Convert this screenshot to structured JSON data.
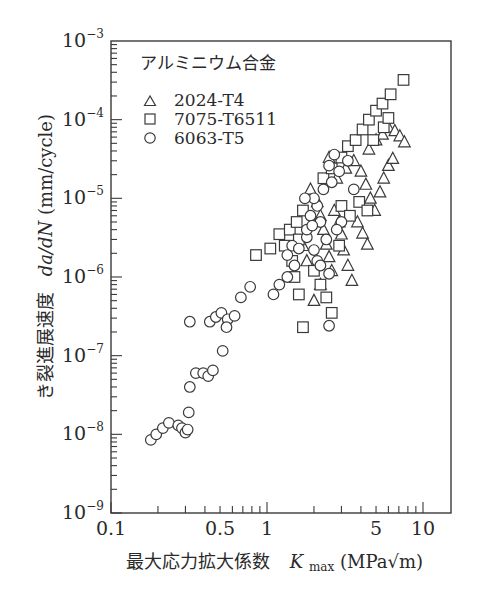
{
  "chart_data": {
    "type": "scatter",
    "title": "",
    "xlabel": "最大応力拡大係数  K_max (MPa√m)",
    "xlabel_parts": {
      "prefix": "最大応力拡大係数",
      "symbol": "K",
      "subscript": "max",
      "unit": "(MPa√m)"
    },
    "ylabel": "き裂進展速度  da/dN (mm/cycle)",
    "ylabel_parts": {
      "prefix": "き裂進展速度",
      "symbol": "da/dN",
      "unit": "(mm/cycle)"
    },
    "xscale": "log",
    "yscale": "log",
    "xlim": [
      0.1,
      15
    ],
    "ylim": [
      1e-09,
      0.001
    ],
    "x_tick_labels": [
      "0.1",
      "0.5",
      "1",
      "5",
      "10"
    ],
    "x_tick_values": [
      0.1,
      0.5,
      1,
      5,
      10
    ],
    "y_tick_labels": [
      {
        "base": "10",
        "exp": "−9",
        "value": 1e-09
      },
      {
        "base": "10",
        "exp": "−8",
        "value": 1e-08
      },
      {
        "base": "10",
        "exp": "−7",
        "value": 1e-07
      },
      {
        "base": "10",
        "exp": "−6",
        "value": 1e-06
      },
      {
        "base": "10",
        "exp": "−5",
        "value": 1e-05
      },
      {
        "base": "10",
        "exp": "−4",
        "value": 0.0001
      },
      {
        "base": "10",
        "exp": "−3",
        "value": 0.001
      }
    ],
    "grid": false,
    "legend": {
      "title": "アルミニウム合金",
      "position": "upper-left",
      "entries": [
        {
          "marker": "triangle",
          "label": "2024-T4"
        },
        {
          "marker": "square",
          "label": "7075-T6511"
        },
        {
          "marker": "circle",
          "label": "6063-T5"
        }
      ]
    },
    "series": [
      {
        "name": "2024-T4",
        "marker": "triangle",
        "points": [
          [
            1.9,
            1.3e-05
          ],
          [
            2.1,
            9e-06
          ],
          [
            2.2,
            6e-06
          ],
          [
            2.3,
            4e-06
          ],
          [
            2.4,
            2.6e-06
          ],
          [
            2.5,
            1.8e-06
          ],
          [
            2.6,
            1.2e-06
          ],
          [
            2.2,
            8e-07
          ],
          [
            2.0,
            5e-07
          ],
          [
            2.7,
            7e-06
          ],
          [
            2.9,
            5e-06
          ],
          [
            3.0,
            3.5e-06
          ],
          [
            3.1,
            2.2e-06
          ],
          [
            3.3,
            1.4e-06
          ],
          [
            3.5,
            9e-07
          ],
          [
            2.8,
            1.8e-05
          ],
          [
            3.2,
            2.4e-05
          ],
          [
            3.6,
            3e-05
          ],
          [
            4.0,
            2.2e-05
          ],
          [
            4.3,
            1.5e-05
          ],
          [
            4.6,
            1e-05
          ],
          [
            4.9,
            7e-06
          ],
          [
            5.3,
            1.2e-05
          ],
          [
            5.6,
            1.8e-05
          ],
          [
            6.0,
            2.6e-05
          ],
          [
            6.4,
            3.2e-05
          ],
          [
            4.5,
            4.2e-05
          ],
          [
            5.0,
            5.5e-05
          ],
          [
            5.5,
            6.5e-05
          ],
          [
            6.0,
            8e-05
          ],
          [
            6.6,
            7.2e-05
          ],
          [
            7.1,
            6.2e-05
          ],
          [
            7.6,
            5.2e-05
          ],
          [
            3.8,
            5e-06
          ],
          [
            4.1,
            3.6e-06
          ],
          [
            4.4,
            2.6e-06
          ],
          [
            2.5,
            3.3e-05
          ],
          [
            1.7,
            2.5e-06
          ],
          [
            1.8,
            1.6e-06
          ]
        ]
      },
      {
        "name": "7075-T6511",
        "marker": "square",
        "points": [
          [
            0.85,
            1.9e-06
          ],
          [
            1.05,
            2.3e-06
          ],
          [
            1.2,
            3.5e-06
          ],
          [
            1.3,
            2.5e-06
          ],
          [
            1.4,
            4e-06
          ],
          [
            1.55,
            5e-06
          ],
          [
            1.7,
            7e-06
          ],
          [
            1.6,
            3e-06
          ],
          [
            1.45,
            1.6e-06
          ],
          [
            1.5,
            1e-06
          ],
          [
            1.6,
            6e-07
          ],
          [
            1.7,
            2.3e-07
          ],
          [
            2.0,
            1.2e-06
          ],
          [
            2.2,
            8e-07
          ],
          [
            2.4,
            5.5e-07
          ],
          [
            2.6,
            3.5e-07
          ],
          [
            2.3,
            1.8e-05
          ],
          [
            2.6,
            2.4e-05
          ],
          [
            3.0,
            3.3e-05
          ],
          [
            3.3,
            4.6e-05
          ],
          [
            3.7,
            5.5e-05
          ],
          [
            4.1,
            7.5e-05
          ],
          [
            4.5,
            0.0001
          ],
          [
            5.0,
            0.00013
          ],
          [
            5.5,
            0.00016
          ],
          [
            6.2,
            0.00021
          ],
          [
            7.5,
            0.00032
          ],
          [
            4.8,
            5.5e-05
          ],
          [
            5.6,
            8e-05
          ],
          [
            6.0,
            0.000105
          ],
          [
            3.0,
            8e-06
          ],
          [
            3.4,
            6e-06
          ],
          [
            3.9,
            9e-06
          ],
          [
            4.4,
            7e-06
          ],
          [
            2.9,
            2.5e-06
          ]
        ]
      },
      {
        "name": "6063-T5",
        "marker": "circle",
        "points": [
          [
            0.18,
            8.5e-09
          ],
          [
            0.195,
            1e-08
          ],
          [
            0.215,
            1.2e-08
          ],
          [
            0.235,
            1.4e-08
          ],
          [
            0.27,
            1.3e-08
          ],
          [
            0.285,
            1.2e-08
          ],
          [
            0.3,
            1.05e-08
          ],
          [
            0.31,
            1.15e-08
          ],
          [
            0.315,
            1.9e-08
          ],
          [
            0.32,
            4e-08
          ],
          [
            0.35,
            6e-08
          ],
          [
            0.39,
            6e-08
          ],
          [
            0.42,
            5.5e-08
          ],
          [
            0.45,
            6.5e-08
          ],
          [
            0.52,
            1.15e-07
          ],
          [
            0.32,
            2.7e-07
          ],
          [
            0.43,
            2.7e-07
          ],
          [
            0.47,
            3.1e-07
          ],
          [
            0.51,
            3.5e-07
          ],
          [
            0.56,
            2.9e-07
          ],
          [
            0.62,
            3.2e-07
          ],
          [
            0.55,
            2.3e-07
          ],
          [
            0.68,
            5.5e-07
          ],
          [
            0.78,
            7.5e-07
          ],
          [
            1.1,
            6e-07
          ],
          [
            1.2,
            8e-07
          ],
          [
            1.35,
            1e-06
          ],
          [
            1.5,
            1.4e-06
          ],
          [
            1.35,
            1.9e-06
          ],
          [
            1.45,
            2.5e-06
          ],
          [
            1.6,
            2.3e-06
          ],
          [
            1.8,
            3.2e-06
          ],
          [
            2.0,
            2.2e-06
          ],
          [
            2.1,
            1.6e-06
          ],
          [
            2.2,
            1.4e-06
          ],
          [
            2.5,
            1.1e-06
          ],
          [
            2.5,
            2.4e-07
          ],
          [
            1.8,
            4e-06
          ],
          [
            1.9,
            6e-06
          ],
          [
            2.1,
            8e-06
          ],
          [
            2.0,
            1e-05
          ],
          [
            2.3,
            1.3e-05
          ],
          [
            2.6,
            1.6e-05
          ],
          [
            2.9,
            2.2e-05
          ],
          [
            3.3,
            3e-05
          ],
          [
            2.7,
            3.6e-05
          ],
          [
            2.5,
            2.6e-05
          ],
          [
            1.75,
            1e-05
          ],
          [
            3.0,
            5e-06
          ],
          [
            2.8,
            4e-06
          ],
          [
            3.6,
            1.3e-05
          ],
          [
            2.4,
            3e-06
          ],
          [
            2.2,
            5e-06
          ],
          [
            1.95,
            4.5e-06
          ]
        ]
      }
    ]
  }
}
